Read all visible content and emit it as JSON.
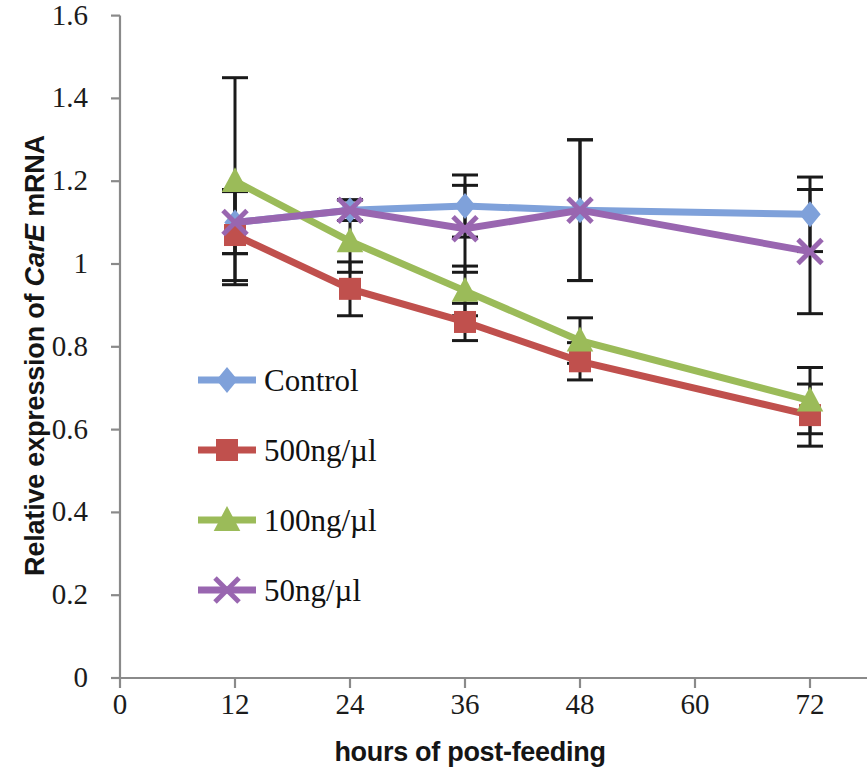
{
  "chart_data": {
    "type": "line",
    "title": "",
    "subtitle": "",
    "xlabel": "hours of post-feeding",
    "ylabel": "Relative expression of CarE mRNA",
    "ylabel_parts": {
      "prefix": "Relative expression of ",
      "italic": "CarE",
      "suffix": " mRNA"
    },
    "x": [
      12,
      24,
      36,
      48,
      72
    ],
    "categories": [
      "12",
      "24",
      "36",
      "48",
      "72"
    ],
    "xlim": [
      0,
      78
    ],
    "ylim": [
      0,
      1.6
    ],
    "x_ticks": [
      0,
      12,
      24,
      36,
      48,
      60,
      72
    ],
    "x_tick_labels": [
      "0",
      "12",
      "24",
      "36",
      "48",
      "60",
      "72"
    ],
    "y_ticks": [
      0,
      0.2,
      0.4,
      0.6,
      0.8,
      1.0,
      1.2,
      1.4,
      1.6
    ],
    "y_tick_labels": [
      "0",
      "0.2",
      "0.4",
      "0.6",
      "0.8",
      "1",
      "1.2",
      "1.4",
      "1.6"
    ],
    "grid": false,
    "legend_position": "inside-left",
    "error_bars": true,
    "series": [
      {
        "name": "Control",
        "color": "#7FA1DA",
        "marker": "diamond",
        "values": [
          1.1,
          1.13,
          1.14,
          1.13,
          1.12
        ],
        "errors": [
          0.075,
          0.025,
          0.075,
          0.17,
          0.09
        ]
      },
      {
        "name": "500ng/µl",
        "color": "#C0504D",
        "marker": "square",
        "values": [
          1.07,
          0.94,
          0.86,
          0.765,
          0.635
        ],
        "errors": [
          0.11,
          0.065,
          0.045,
          0.045,
          0.075
        ]
      },
      {
        "name": "100ng/µl",
        "color": "#9BBB59",
        "marker": "triangle",
        "values": [
          1.2,
          1.055,
          0.935,
          0.815,
          0.67
        ],
        "errors": [
          0.25,
          0.075,
          0.06,
          0.055,
          0.08
        ]
      },
      {
        "name": "50ng/µl",
        "color": "#9966B0",
        "marker": "cross",
        "values": [
          1.1,
          1.13,
          1.085,
          1.13,
          1.03
        ],
        "errors": [
          0.075,
          0.025,
          0.105,
          0.17,
          0.15
        ]
      }
    ]
  },
  "legend": {
    "items": [
      {
        "label": "Control",
        "color": "#7FA1DA",
        "marker": "diamond"
      },
      {
        "label": "500ng/µl",
        "color": "#C0504D",
        "marker": "square"
      },
      {
        "label": "100ng/µl",
        "color": "#9BBB59",
        "marker": "triangle"
      },
      {
        "label": "50ng/µl",
        "color": "#9966B0",
        "marker": "cross"
      }
    ]
  },
  "axis": {
    "line_color": "#8a8a8a",
    "error_bar_color": "#1a1a1a"
  }
}
